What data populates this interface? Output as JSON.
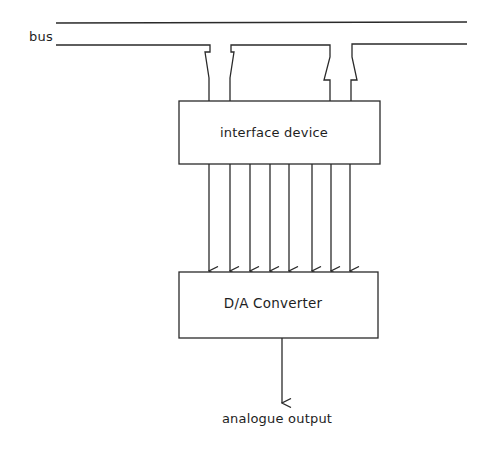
{
  "diagram": {
    "title": "",
    "bus": {
      "label": "bus",
      "line_count": 2
    },
    "blocks": [
      {
        "id": "interface",
        "label": "interface device"
      },
      {
        "id": "dac",
        "label": "D/A Converter"
      }
    ],
    "connections": {
      "bus_to_interface": "two bus tap connectors",
      "interface_to_dac": {
        "parallel_lines": 8,
        "direction": "down"
      },
      "dac_to_output": {
        "lines": 1,
        "direction": "down"
      }
    },
    "output": {
      "label": "analogue output"
    },
    "colors": {
      "line": "#2a2a2a",
      "background": "#ffffff"
    }
  }
}
